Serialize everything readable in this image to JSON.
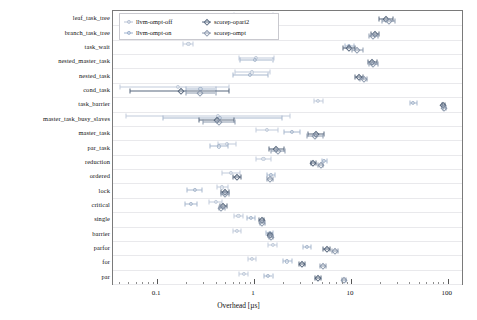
{
  "chart_data": {
    "type": "scatter",
    "title": "",
    "xlabel": "Overhead [µs]",
    "ylabel": "",
    "xscale": "log",
    "xlim": [
      0.035,
      140
    ],
    "xticks": [
      0.1,
      1,
      10,
      100
    ],
    "xticklabels": [
      "0.1",
      "1",
      "10",
      "100"
    ],
    "grid": true,
    "legend_position": "top-left",
    "legend": [
      {
        "name": "llvm-ompt-off",
        "marker": "circle",
        "color": "#b9c4d6"
      },
      {
        "name": "llvm-ompt-on",
        "marker": "circle",
        "color": "#9fb3cf"
      },
      {
        "name": "scorep-opari2",
        "marker": "diamond",
        "color": "#5f6f86"
      },
      {
        "name": "scorep-ompt",
        "marker": "diamond",
        "color": "#8f9bb0"
      }
    ],
    "categories": [
      "leaf_task_tree",
      "branch_task_tree",
      "task_wait",
      "nested_master_task",
      "nested_task",
      "cond_task",
      "task_barrier",
      "master_task_busy_slaves",
      "master_task",
      "par_task",
      "reduction",
      "ordered",
      "lock",
      "critical",
      "single",
      "barrier",
      "parfor",
      "for",
      "par"
    ],
    "series": [
      {
        "name": "llvm-ompt-off",
        "marker": "circle",
        "color": "#c2ccdb",
        "values": [
          1.0,
          1.0,
          0.21,
          1.05,
          0.95,
          0.165,
          4.6,
          0.42,
          1.35,
          0.52,
          1.25,
          0.58,
          0.47,
          0.4,
          0.69,
          0.66,
          1.55,
          0.95,
          0.78
        ],
        "lo": [
          0.62,
          0.66,
          0.185,
          0.7,
          0.64,
          0.041,
          4.2,
          0.048,
          1.05,
          0.42,
          1.05,
          0.47,
          0.41,
          0.34,
          0.62,
          0.6,
          1.4,
          0.86,
          0.7
        ],
        "hi": [
          1.58,
          1.5,
          0.235,
          1.6,
          1.45,
          0.55,
          5.1,
          2.35,
          1.75,
          0.65,
          1.48,
          0.72,
          0.54,
          0.47,
          0.77,
          0.73,
          1.72,
          1.05,
          0.87
        ]
      },
      {
        "name": "llvm-ompt-on",
        "marker": "circle",
        "color": "#a8b8cd",
        "values": [
          0.97,
          0.97,
          9.6,
          1.03,
          0.9,
          0.28,
          44.0,
          0.44,
          2.45,
          0.43,
          5.3,
          1.5,
          0.245,
          0.225,
          0.92,
          1.45,
          3.5,
          2.2,
          1.4
        ],
        "lo": [
          0.6,
          0.62,
          8.6,
          0.72,
          0.6,
          0.2,
          41.0,
          0.115,
          2.05,
          0.35,
          5.0,
          1.36,
          0.205,
          0.195,
          0.84,
          1.33,
          3.2,
          2.0,
          1.28
        ],
        "hi": [
          1.45,
          1.42,
          10.8,
          1.55,
          1.4,
          0.4,
          47.5,
          1.95,
          2.95,
          0.54,
          5.6,
          1.66,
          0.29,
          0.26,
          1.02,
          1.58,
          3.9,
          2.45,
          1.55
        ]
      },
      {
        "name": "scorep-opari2",
        "marker": "diamond",
        "color": "#59687e",
        "values": [
          23.0,
          17.5,
          9.5,
          16.5,
          12.0,
          0.175,
          90.0,
          0.41,
          4.4,
          1.7,
          4.1,
          0.66,
          0.5,
          0.475,
          1.2,
          1.45,
          5.6,
          3.1,
          4.6
        ],
        "lo": [
          19.5,
          16.0,
          8.2,
          15.0,
          11.0,
          0.053,
          88.0,
          0.27,
          3.6,
          1.42,
          3.9,
          0.6,
          0.46,
          0.44,
          1.13,
          1.38,
          5.2,
          2.9,
          4.3
        ],
        "hi": [
          27.0,
          19.5,
          11.0,
          18.5,
          13.2,
          0.55,
          93.0,
          0.62,
          5.3,
          2.05,
          4.4,
          0.73,
          0.55,
          0.52,
          1.28,
          1.54,
          6.1,
          3.35,
          4.9
        ]
      },
      {
        "name": "scorep-ompt",
        "marker": "diamond",
        "color": "#8c99ad",
        "values": [
          24.5,
          16.8,
          11.5,
          17.0,
          13.5,
          0.28,
          92.0,
          0.43,
          4.3,
          1.75,
          4.9,
          1.45,
          0.5,
          0.46,
          1.22,
          1.48,
          6.9,
          5.1,
          8.4
        ],
        "lo": [
          21.0,
          15.2,
          10.2,
          15.5,
          12.3,
          0.2,
          90.0,
          0.3,
          3.5,
          1.48,
          4.6,
          1.36,
          0.46,
          0.43,
          1.15,
          1.41,
          6.4,
          4.8,
          8.0
        ],
        "hi": [
          28.5,
          18.8,
          13.2,
          19.0,
          14.8,
          0.4,
          95.0,
          0.63,
          5.2,
          2.1,
          5.2,
          1.56,
          0.55,
          0.5,
          1.3,
          1.56,
          7.4,
          5.5,
          8.9
        ]
      }
    ]
  },
  "axis": {
    "x_title": "Overhead [µs]"
  }
}
